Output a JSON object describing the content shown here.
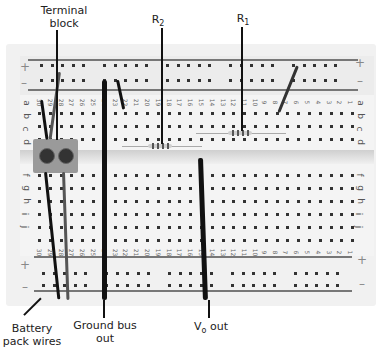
{
  "annotations": {
    "terminal_block": {
      "line1": "Terminal",
      "line2": "block"
    },
    "r2": {
      "base": "R",
      "sub": "2"
    },
    "r1": {
      "base": "R",
      "sub": "1"
    },
    "battery": {
      "line1": "Battery",
      "line2": "pack wires"
    },
    "ground": {
      "line1": "Ground bus",
      "line2": "out"
    },
    "vo": {
      "base": "V",
      "sub": "o",
      "suffix": " out"
    }
  },
  "breadboard": {
    "rail_signs": {
      "plus": "+",
      "minus": "–"
    },
    "row_labels_top": [
      "a",
      "b",
      "c",
      "d",
      "e"
    ],
    "row_labels_bottom": [
      "f",
      "g",
      "h",
      "i",
      "j"
    ],
    "column_numbers": [
      "30",
      "29",
      "28",
      "27",
      "26",
      "25",
      "24",
      "23",
      "22",
      "21",
      "20",
      "19",
      "18",
      "17",
      "16",
      "15",
      "14",
      "13",
      "12",
      "11",
      "10",
      "9",
      "8",
      "7",
      "6",
      "5",
      "4",
      "3",
      "2",
      "1"
    ]
  }
}
